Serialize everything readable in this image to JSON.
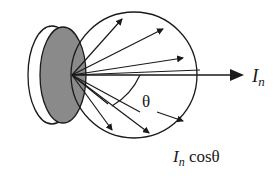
{
  "diagram": {
    "labels": {
      "normal_intensity": "I",
      "normal_intensity_sub": "n",
      "angled_intensity": "I",
      "angled_intensity_sub": "n",
      "angled_intensity_suffix": " cosθ",
      "angle": "θ"
    },
    "colors": {
      "stroke": "#1a1a1a",
      "disk_fill": "#8a8a8a",
      "background": "#ffffff"
    }
  }
}
